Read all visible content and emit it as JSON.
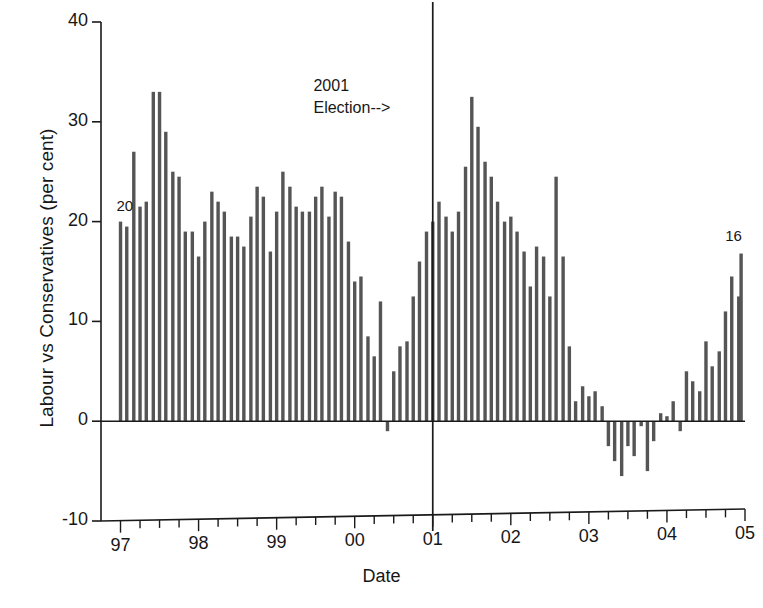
{
  "chart_data": {
    "type": "bar",
    "title": "",
    "subtitle": "",
    "xlabel": "Date",
    "ylabel": "Labour vs Conservatives (per cent)",
    "ylim": [
      -10,
      40
    ],
    "xlim": [
      1996.75,
      2005.0
    ],
    "yticks": [
      -10,
      0,
      10,
      20,
      30,
      40
    ],
    "ytick_labels": [
      "-10",
      "0",
      "10",
      "20",
      "30",
      "40"
    ],
    "xticks": [
      1997,
      1998,
      1999,
      2000,
      2001,
      2002,
      2003,
      2004,
      2005
    ],
    "xtick_labels": [
      "97",
      "98",
      "99",
      "00",
      "01",
      "02",
      "03",
      "04",
      "05"
    ],
    "minor_xticks_per_year": 4,
    "grid": false,
    "legend": null,
    "bar_color": "#555555",
    "axis_color": "#1a1a1a",
    "annotations": [
      {
        "name": "election-annotation",
        "text": "2001\nElection-->",
        "x": 1999.6,
        "y": 33.5
      },
      {
        "name": "first-value-label",
        "text": "20",
        "x": 1997.0,
        "y": 21.5
      },
      {
        "name": "last-value-label",
        "text": "16",
        "x": 2004.72,
        "y": 18.5
      }
    ],
    "vlines": [
      {
        "name": "election-line",
        "x": 2001.0,
        "label": "2001 General Election",
        "ymin": -10,
        "ymax": 42
      }
    ],
    "x": [
      1997.0,
      1997.08,
      1997.17,
      1997.25,
      1997.33,
      1997.42,
      1997.5,
      1997.58,
      1997.67,
      1997.75,
      1997.83,
      1997.92,
      1998.0,
      1998.08,
      1998.17,
      1998.25,
      1998.33,
      1998.42,
      1998.5,
      1998.58,
      1998.67,
      1998.75,
      1998.83,
      1998.92,
      1999.0,
      1999.08,
      1999.17,
      1999.25,
      1999.33,
      1999.42,
      1999.5,
      1999.58,
      1999.67,
      1999.75,
      1999.83,
      1999.92,
      2000.0,
      2000.08,
      2000.17,
      2000.25,
      2000.33,
      2000.42,
      2000.5,
      2000.58,
      2000.67,
      2000.75,
      2000.83,
      2000.92,
      2001.0,
      2001.08,
      2001.17,
      2001.25,
      2001.33,
      2001.42,
      2001.5,
      2001.58,
      2001.67,
      2001.75,
      2001.83,
      2001.92,
      2002.0,
      2002.08,
      2002.17,
      2002.25,
      2002.33,
      2002.42,
      2002.5,
      2002.58,
      2002.67,
      2002.75,
      2002.83,
      2002.92,
      2003.0,
      2003.08,
      2003.17,
      2003.25,
      2003.33,
      2003.42,
      2003.5,
      2003.58,
      2003.67,
      2003.75,
      2003.83,
      2003.92,
      2004.0,
      2004.08,
      2004.17,
      2004.25,
      2004.33,
      2004.42,
      2004.5,
      2004.58,
      2004.67,
      2004.75,
      2004.83,
      2004.92
    ],
    "values": [
      20.0,
      19.5,
      27.0,
      21.5,
      22.0,
      33.0,
      33.0,
      29.0,
      25.0,
      24.5,
      19.0,
      19.0,
      16.5,
      20.0,
      23.0,
      22.0,
      21.0,
      18.5,
      18.5,
      17.5,
      20.5,
      23.5,
      22.5,
      17.0,
      21.0,
      25.0,
      23.5,
      21.5,
      21.0,
      21.0,
      22.5,
      23.5,
      20.5,
      23.0,
      22.5,
      18.0,
      14.0,
      14.5,
      8.5,
      6.5,
      12.0,
      -1.0,
      5.0,
      7.5,
      8.0,
      12.5,
      16.0,
      19.0,
      20.0,
      22.0,
      20.5,
      19.0,
      21.0,
      25.5,
      32.5,
      29.5,
      26.0,
      24.5,
      22.0,
      20.0,
      20.5,
      19.0,
      17.0,
      13.5,
      17.5,
      16.5,
      12.5,
      24.5,
      16.5,
      7.5,
      2.0,
      3.5,
      2.5,
      3.0,
      1.5,
      -2.5,
      -4.0,
      -5.5,
      -2.5,
      -3.5,
      -0.5,
      -5.0,
      -2.0,
      0.8,
      0.5,
      2.0,
      -1.0,
      5.0,
      4.0,
      3.0,
      8.0,
      5.5,
      7.0,
      11.0,
      14.5,
      12.5
    ],
    "last_point_extra": 16.8
  },
  "figure": {
    "background": "#ffffff",
    "plot_area": {
      "left": 101,
      "right": 745,
      "top": 22,
      "bottom": 521
    },
    "zero_line_y": 424
  }
}
